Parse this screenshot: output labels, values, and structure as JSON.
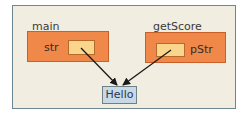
{
  "diagram": {
    "frames": [
      {
        "name": "main",
        "variable": "str"
      },
      {
        "name": "getScore",
        "variable": "pStr"
      }
    ],
    "heap_value": "Hello",
    "colors": {
      "background": "#f1ede0",
      "frame_border": "#6c8792",
      "stack_frame_fill": "#f0884a",
      "pointer_cell_fill": "#f9d68c",
      "heap_fill": "#c7d9e6",
      "arrow": "#1a1a1a"
    }
  }
}
